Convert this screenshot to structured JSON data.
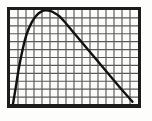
{
  "figure": {
    "title": "",
    "background_color": "#fdfdfc",
    "frame_color": "#1c1c1c",
    "plot_background": "#fbfbfa"
  },
  "grid": {
    "columns": 16,
    "rows": 12,
    "line_color": "#5a5a58",
    "minor_line_color": "#bdbdba",
    "cell_color": "#fbfbfa",
    "visible": true
  },
  "chart_data": {
    "type": "line",
    "title": "",
    "xlabel": "",
    "ylabel": "",
    "grid": true,
    "legend_position": "none",
    "xlim": [
      0,
      16
    ],
    "ylim": [
      0,
      12
    ],
    "series": [
      {
        "name": "curve",
        "color": "#111111",
        "line_width": 2.4,
        "x": [
          0.35,
          0.7,
          1.1,
          1.6,
          2.1,
          2.7,
          3.3,
          3.9,
          4.5,
          5.1,
          5.6,
          6.2,
          7.0,
          8.0,
          9.0,
          10.0,
          11.0,
          12.0,
          13.0,
          14.0,
          14.8,
          15.3
        ],
        "y": [
          0.0,
          2.1,
          4.6,
          7.1,
          9.0,
          10.4,
          11.3,
          11.8,
          11.95,
          11.85,
          11.6,
          11.2,
          10.3,
          9.1,
          7.9,
          6.7,
          5.5,
          4.3,
          3.1,
          1.9,
          1.0,
          0.4
        ]
      }
    ]
  }
}
